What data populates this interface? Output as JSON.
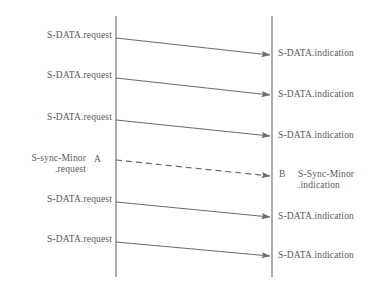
{
  "diagram": {
    "type": "sequence-diagram",
    "background_color": "#ffffff",
    "line_color": "#6b6b6e",
    "text_color": "#58585a",
    "lifelines": [
      {
        "name": "left-lifeline",
        "x": 116,
        "y_top": 16,
        "y_bottom": 277
      },
      {
        "name": "right-lifeline",
        "x": 272,
        "y_top": 16,
        "y_bottom": 277
      }
    ],
    "messages": [
      {
        "id": 1,
        "style": "solid",
        "direction": "left-to-right",
        "x1": 116,
        "y1": 38,
        "x2": 270,
        "y2": 55,
        "source_label": "S-DATA.request",
        "source_label_x": 112,
        "source_label_y": 30,
        "target_label": "S-DATA.indication",
        "target_label_x": 278,
        "target_label_y": 48
      },
      {
        "id": 2,
        "style": "solid",
        "direction": "left-to-right",
        "x1": 116,
        "y1": 78,
        "x2": 270,
        "y2": 95,
        "source_label": "S-DATA.request",
        "source_label_x": 112,
        "source_label_y": 70,
        "target_label": "S-DATA.indication",
        "target_label_x": 278,
        "target_label_y": 89
      },
      {
        "id": 3,
        "style": "solid",
        "direction": "left-to-right",
        "x1": 116,
        "y1": 120,
        "x2": 270,
        "y2": 136,
        "source_label": "S-DATA.request",
        "source_label_x": 112,
        "source_label_y": 112,
        "target_label": "S-DATA.indication",
        "target_label_x": 278,
        "target_label_y": 130
      },
      {
        "id": 4,
        "style": "dashed",
        "direction": "left-to-right",
        "x1": 116,
        "y1": 160,
        "x2": 270,
        "y2": 176,
        "source_label": "S-sync-Minor\n.request",
        "source_label_x": 86,
        "source_label_y": 153,
        "source_marker": "A",
        "source_marker_x": 94,
        "source_marker_y": 154,
        "target_label": "S-Sync-Minor\n.indication",
        "target_label_x": 298,
        "target_label_y": 169,
        "target_marker": "B",
        "target_marker_x": 279,
        "target_marker_y": 169
      },
      {
        "id": 5,
        "style": "solid",
        "direction": "left-to-right",
        "x1": 116,
        "y1": 202,
        "x2": 270,
        "y2": 217,
        "source_label": "S-DATA.request",
        "source_label_x": 112,
        "source_label_y": 194,
        "target_label": "S-DATA.indication",
        "target_label_x": 278,
        "target_label_y": 211
      },
      {
        "id": 6,
        "style": "solid",
        "direction": "left-to-right",
        "x1": 116,
        "y1": 242,
        "x2": 270,
        "y2": 256,
        "source_label": "S-DATA.request",
        "source_label_x": 112,
        "source_label_y": 234,
        "target_label": "S-DATA.indication",
        "target_label_x": 278,
        "target_label_y": 250
      }
    ]
  }
}
